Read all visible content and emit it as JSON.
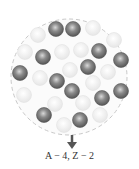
{
  "diagram": {
    "label": "A − 4, Z − 2",
    "colors": {
      "proton": "#6b6b6b",
      "neutron": "#efefef",
      "boundary": "#c8c8c8",
      "arrow": "#555555"
    },
    "nucleus": {
      "cx": 69,
      "cy": 77,
      "r": 58
    },
    "protons": [
      [
        56,
        29
      ],
      [
        73,
        29
      ],
      [
        43,
        57
      ],
      [
        99,
        51
      ],
      [
        121,
        60
      ],
      [
        20,
        73
      ],
      [
        88,
        67
      ],
      [
        57,
        81
      ],
      [
        72,
        91
      ],
      [
        121,
        91
      ],
      [
        102,
        98
      ],
      [
        44,
        115
      ],
      [
        80,
        120
      ]
    ],
    "neutrons": [
      [
        38,
        35
      ],
      [
        93,
        28
      ],
      [
        114,
        40
      ],
      [
        25,
        52
      ],
      [
        62,
        52
      ],
      [
        81,
        50
      ],
      [
        70,
        70
      ],
      [
        108,
        72
      ],
      [
        40,
        78
      ],
      [
        93,
        83
      ],
      [
        24,
        95
      ],
      [
        55,
        104
      ],
      [
        83,
        103
      ],
      [
        64,
        125
      ],
      [
        100,
        115
      ]
    ],
    "ball_radius": 7.5
  }
}
